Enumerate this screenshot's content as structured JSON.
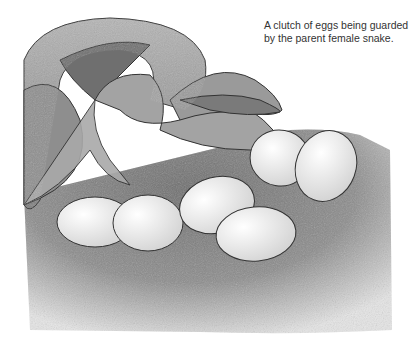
{
  "caption": {
    "line1": "A clutch of eggs being guarded",
    "line2": "by the parent female snake."
  },
  "illustration": {
    "subject": "snake coiled beside clutch of eggs on sandy ground",
    "egg_count": 7,
    "colors": {
      "sand": "#8a8a8a",
      "snake": "#9a9a9a",
      "egg": "#f2f2f2",
      "outline": "#333333"
    }
  }
}
